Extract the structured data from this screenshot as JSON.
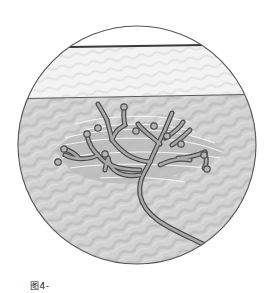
{
  "figure": {
    "caption": "图4-",
    "colors": {
      "background": "#ffffff",
      "upper_layer": "#f2f2f2",
      "lower_layer": "#cfcfcf",
      "cluster_region": "#bdbdbd",
      "outline": "#555555",
      "top_thick_line": "#3a3a3a",
      "nerve_fill": "#a9a9a9",
      "nerve_stroke": "#4a4a4a",
      "fiber_lines": "#f4f4f4"
    },
    "circle": {
      "cx": 137,
      "cy": 145,
      "r": 119
    },
    "layers": [
      {
        "name": "surface-band",
        "top_line_y_left": 48,
        "top_line_y_right": 45
      },
      {
        "name": "upper-layer",
        "boundary_y_left": 98,
        "boundary_y_right": 94
      },
      {
        "name": "lower-layer"
      }
    ],
    "nerve_terminal_bulbs": 12
  }
}
